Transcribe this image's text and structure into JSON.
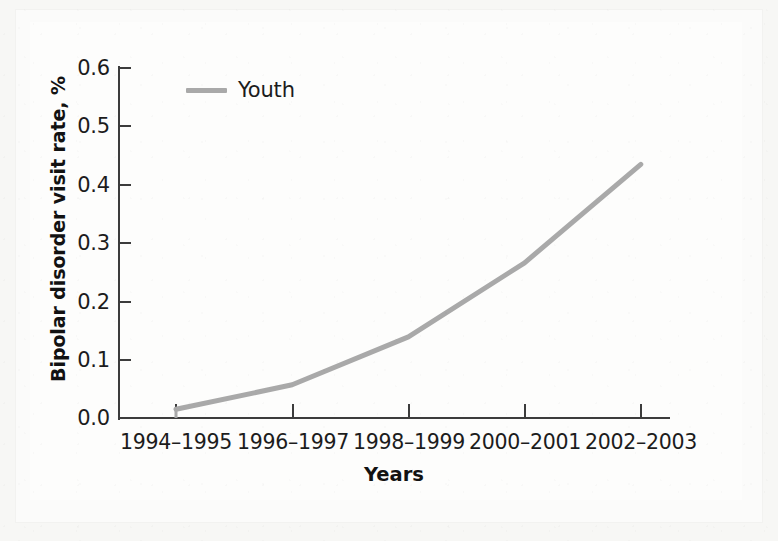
{
  "chart_data": {
    "type": "line",
    "title": "",
    "xlabel": "Years",
    "ylabel": "Bipolar disorder visit rate, %",
    "categories": [
      "1994–1995",
      "1996–1997",
      "1998–1999",
      "2000–2001",
      "2002–2003"
    ],
    "series": [
      {
        "name": "Youth",
        "color": "#a9a9a9",
        "values": [
          0.015,
          0.057,
          0.139,
          0.266,
          0.435
        ]
      }
    ],
    "ylim": [
      0.0,
      0.6
    ],
    "ytick_labels": [
      "0.0",
      "0.1",
      "0.2",
      "0.3",
      "0.4",
      "0.5",
      "0.6"
    ],
    "ytick_values": [
      0.0,
      0.1,
      0.2,
      0.3,
      0.4,
      0.5,
      0.6
    ],
    "grid": false,
    "legend_position": "top-left-inside",
    "legend_entries": [
      "Youth"
    ]
  },
  "axes": {
    "y_title": "Bipolar disorder visit rate, %",
    "x_title": "Years",
    "y_ticks": [
      "0.0",
      "0.1",
      "0.2",
      "0.3",
      "0.4",
      "0.5",
      "0.6"
    ],
    "x_ticks": [
      "1994–1995",
      "1996–1997",
      "1998–1999",
      "2000–2001",
      "2002–2003"
    ]
  },
  "legend": {
    "label": "Youth"
  },
  "colors": {
    "series_line": "#a9a9a9",
    "axis": "#3c3c3c",
    "text": "#1c1c1c",
    "page_background": "#fbfbfa"
  }
}
